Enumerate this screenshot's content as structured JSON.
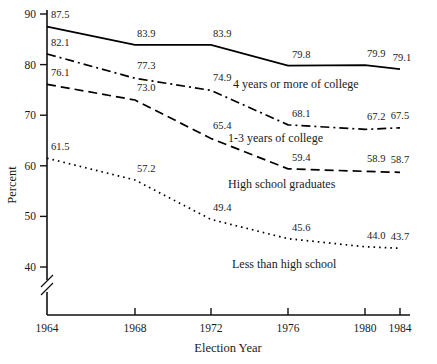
{
  "chart_data": {
    "type": "line",
    "title": "",
    "xlabel": "Election Year",
    "ylabel": "Percent",
    "x": [
      1964,
      1968,
      1972,
      1976,
      1980,
      1984
    ],
    "xticklabels": [
      "1964",
      "1968",
      "1972",
      "1976",
      "1980",
      "1984"
    ],
    "yticklabels": [
      "40",
      "50",
      "60",
      "70",
      "80",
      "90"
    ],
    "yticks": [
      40,
      50,
      60,
      70,
      80,
      90
    ],
    "ylim": [
      40,
      90
    ],
    "y_axis_break": true,
    "grid": false,
    "legend": "inline-labels",
    "series": [
      {
        "name": "4 years or more of college",
        "style": "solid",
        "values": [
          87.5,
          83.9,
          83.9,
          79.8,
          79.9,
          79.1
        ],
        "labels": [
          "87.5",
          "83.9",
          "83.9",
          "79.8",
          "79.9",
          "79.1"
        ]
      },
      {
        "name": "1-3 years of college",
        "style": "dash-dot",
        "values": [
          82.1,
          77.3,
          74.9,
          68.1,
          67.2,
          67.5
        ],
        "labels": [
          "82.1",
          "77.3",
          "74.9",
          "68.1",
          "67.2",
          "67.5"
        ]
      },
      {
        "name": "High school graduates",
        "style": "dashed",
        "values": [
          76.1,
          73.0,
          65.4,
          59.4,
          58.9,
          58.7
        ],
        "labels": [
          "76.1",
          "73.0",
          "65.4",
          "59.4",
          "58.9",
          "58.7"
        ]
      },
      {
        "name": "Less than high school",
        "style": "dotted",
        "values": [
          61.5,
          57.2,
          49.4,
          45.6,
          44.0,
          43.7
        ],
        "labels": [
          "61.5",
          "57.2",
          "49.4",
          "45.6",
          "44.0",
          "43.7"
        ]
      }
    ]
  },
  "colors": {
    "ink": "#111111",
    "background": "#ffffff"
  }
}
